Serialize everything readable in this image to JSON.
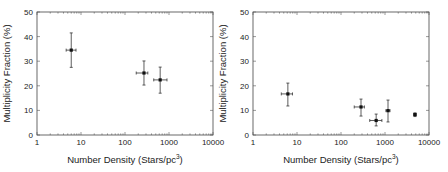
{
  "chart_data": [
    {
      "type": "scatter",
      "title": "",
      "xlabel": "Number Density (Stars/pc^3)",
      "xlabel_main": "Number Density (Stars/pc",
      "xlabel_sup": "3",
      "xlabel_close": ")",
      "ylabel": "Multiplicity Fraction (%)",
      "xscale": "log",
      "xlim": [
        1,
        10000
      ],
      "ylim": [
        0,
        50
      ],
      "xticks": [
        "1",
        "10",
        "100",
        "1000",
        "10000"
      ],
      "yticks": [
        "0",
        "10",
        "20",
        "30",
        "40",
        "50"
      ],
      "grid": false,
      "points": [
        {
          "x": 6,
          "y": 34.5,
          "y_low": 27.5,
          "y_high": 41.5,
          "x_low": 4.6,
          "x_high": 7.7
        },
        {
          "x": 270,
          "y": 25.2,
          "y_low": 20.3,
          "y_high": 30.1,
          "x_low": 180,
          "x_high": 330
        },
        {
          "x": 630,
          "y": 22.4,
          "y_low": 17.0,
          "y_high": 27.6,
          "x_low": 450,
          "x_high": 900
        }
      ]
    },
    {
      "type": "scatter",
      "title": "",
      "xlabel": "Number Density (Stars/pc^3)",
      "xlabel_main": "Number Density (Stars/pc",
      "xlabel_sup": "3",
      "xlabel_close": ")",
      "ylabel": "Multiplicity Fraction (%)",
      "xscale": "log",
      "xlim": [
        1,
        10000
      ],
      "ylim": [
        0,
        50
      ],
      "xticks": [
        "1",
        "10",
        "100",
        "1000",
        "10000"
      ],
      "yticks": [
        "0",
        "10",
        "20",
        "30",
        "40",
        "50"
      ],
      "grid": false,
      "points": [
        {
          "x": 6.2,
          "y": 16.7,
          "y_low": 11.8,
          "y_high": 21.1,
          "x_low": 4.4,
          "x_high": 7.9
        },
        {
          "x": 285,
          "y": 11.4,
          "y_low": 7.7,
          "y_high": 14.6,
          "x_low": 200,
          "x_high": 340
        },
        {
          "x": 630,
          "y": 5.9,
          "y_low": 3.7,
          "y_high": 8.5,
          "x_low": 450,
          "x_high": 850
        },
        {
          "x": 1170,
          "y": 9.9,
          "y_low": 5.3,
          "y_high": 14.2,
          "x_low": 1050,
          "x_high": 1300
        },
        {
          "x": 4800,
          "y": 8.3,
          "y_low": 7.5,
          "y_high": 9.0,
          "x_low": 4500,
          "x_high": 5100
        }
      ]
    }
  ]
}
